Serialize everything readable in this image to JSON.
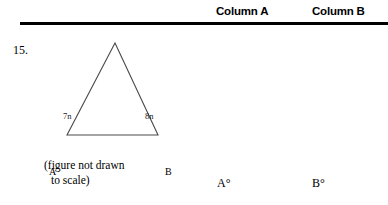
{
  "header": {
    "column_a_label": "Column A",
    "column_b_label": "Column B",
    "rule_color": "#000000"
  },
  "question": {
    "number": "15.",
    "caption_line1": "(figure not drawn",
    "caption_line2": "to scale)"
  },
  "figure": {
    "shape": "triangle",
    "stroke_color": "#4a4a4a",
    "vertices": {
      "apex": "",
      "bottom_left_label": "A",
      "bottom_right_label": "B"
    },
    "side_labels": {
      "left": "7n",
      "right": "8n"
    }
  },
  "answers": {
    "column_a_value": "A°",
    "column_b_value": "B°"
  }
}
